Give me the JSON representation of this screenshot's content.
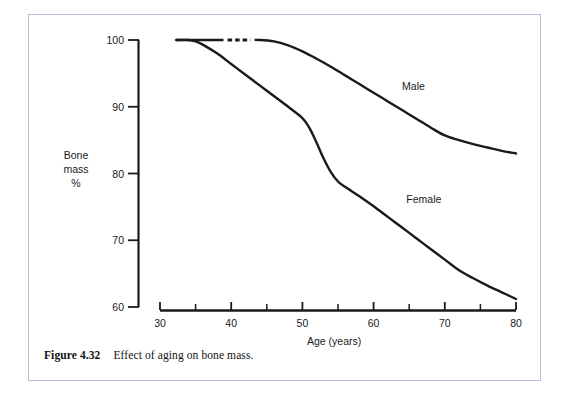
{
  "figure": {
    "caption_number": "Figure 4.32",
    "caption_text": "Effect of aging on bone mass.",
    "frame_color": "#b9bcd8",
    "background_color": "#ffffff"
  },
  "chart_data": {
    "type": "line",
    "title": "",
    "subtitle": "",
    "xlabel": "Age (years)",
    "ylabel": "Bone mass %",
    "ylabel_lines": [
      "Bone",
      "mass",
      "%"
    ],
    "xlim": [
      30,
      80
    ],
    "ylim": [
      60,
      100
    ],
    "x_ticks": [
      30,
      40,
      50,
      60,
      70,
      80
    ],
    "x_tick_labels": [
      "30",
      "40",
      "50",
      "60",
      "70",
      "80"
    ],
    "x_minor_ticks": [
      35,
      45,
      55,
      65,
      75
    ],
    "y_ticks": [
      60,
      70,
      80,
      90,
      100
    ],
    "y_tick_labels": [
      "60",
      "70",
      "80",
      "90",
      "100"
    ],
    "grid": false,
    "legend_position": "inline-annotation",
    "line_color": "#1a1a1a",
    "line_width": 2.4,
    "series": [
      {
        "name": "Male",
        "label_x": 64,
        "label_y": 93,
        "dashed_segment": {
          "x_start": 39.5,
          "x_end": 42.7,
          "y": 100
        },
        "x": [
          32.3,
          34,
          36,
          38,
          40,
          42,
          44,
          46,
          48,
          50,
          52,
          54,
          56,
          58,
          60,
          62,
          64,
          66,
          68,
          70,
          72,
          74,
          76,
          78,
          80
        ],
        "y": [
          100,
          100,
          100,
          100,
          100,
          100,
          100,
          99.8,
          99.2,
          98.3,
          97.2,
          96.0,
          94.7,
          93.4,
          92.1,
          90.8,
          89.5,
          88.2,
          86.9,
          85.7,
          85.0,
          84.4,
          83.9,
          83.4,
          83.0
        ]
      },
      {
        "name": "Female",
        "label_x": 64.6,
        "label_y": 76,
        "x": [
          32.3,
          34,
          35,
          36,
          38,
          40,
          42,
          44,
          46,
          48,
          50,
          51,
          52,
          53,
          54,
          55,
          56,
          58,
          60,
          62,
          64,
          66,
          68,
          70,
          72,
          74,
          76,
          78,
          80
        ],
        "y": [
          100,
          100,
          99.8,
          99.3,
          98.0,
          96.4,
          94.8,
          93.2,
          91.6,
          90.0,
          88.3,
          86.8,
          84.6,
          82.2,
          80.2,
          78.8,
          78.0,
          76.6,
          75.1,
          73.5,
          71.9,
          70.3,
          68.7,
          67.1,
          65.5,
          64.3,
          63.2,
          62.2,
          61.2
        ]
      }
    ]
  },
  "axes": {
    "y_axis_name": "bone-mass-axis",
    "x_axis_name": "age-axis"
  }
}
